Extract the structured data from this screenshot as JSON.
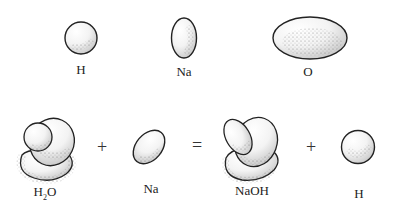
{
  "atoms": [
    {
      "label": "H"
    },
    {
      "label": "Na"
    },
    {
      "label": "O"
    }
  ],
  "equation": {
    "reactant1": {
      "label_main": "H",
      "label_sub": "2",
      "label_tail": "O"
    },
    "op1": "+",
    "reactant2": {
      "label": "Na"
    },
    "equals": "=",
    "product1": {
      "label": "NaOH"
    },
    "op2": "+",
    "product2": {
      "label": "H"
    }
  }
}
